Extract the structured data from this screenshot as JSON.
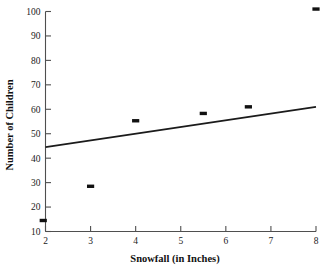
{
  "chart_data": {
    "type": "scatter",
    "title": "",
    "xlabel": "Snowfall (in Inches)",
    "ylabel": "Number of Children",
    "xlim": [
      2,
      8
    ],
    "ylim": [
      10,
      100
    ],
    "xticks": [
      2,
      3,
      4,
      5,
      6,
      7,
      8
    ],
    "xtick_labels": [
      "2",
      "3",
      "4",
      "5",
      "6",
      "7",
      "8"
    ],
    "yticks": [
      10,
      20,
      30,
      40,
      50,
      60,
      70,
      80,
      90,
      100
    ],
    "ytick_labels": [
      "10",
      "20",
      "30",
      "40",
      "50",
      "60",
      "70",
      "80",
      "90",
      "100"
    ],
    "grid": false,
    "legend": "none",
    "marker": "square",
    "marker_color": "#111111",
    "points": [
      {
        "x": 1.95,
        "y": 14.5
      },
      {
        "x": 3.0,
        "y": 28.5
      },
      {
        "x": 4.0,
        "y": 55.3
      },
      {
        "x": 5.5,
        "y": 58.3
      },
      {
        "x": 6.5,
        "y": 61.0
      },
      {
        "x": 8.0,
        "y": 101.0
      }
    ],
    "series": [
      {
        "name": "Observations",
        "x": [
          1.95,
          3.0,
          4.0,
          5.5,
          6.5,
          8.0
        ],
        "values": [
          14.5,
          28.5,
          55.3,
          58.3,
          61.0,
          101.0
        ]
      }
    ],
    "trend_line": {
      "type": "line",
      "name": "Line of best fit",
      "color": "#1b1b1b",
      "x": [
        2,
        8
      ],
      "values": [
        44.5,
        61.0
      ]
    }
  },
  "axes": {
    "x_title": "Snowfall (in Inches)",
    "y_title": "Number of Children"
  }
}
